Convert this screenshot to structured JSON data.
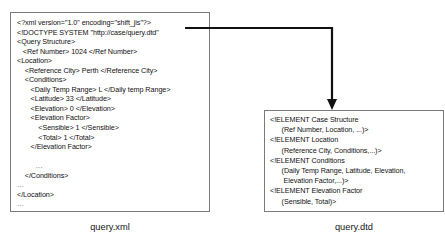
{
  "figure": {
    "xml_panel": {
      "caption": "query.xml",
      "lines": [
        {
          "text": "<?xml version=\"1.0\" encoding=\"shift_jis\"?>",
          "kind": "code"
        },
        {
          "text": "<!DOCTYPE SYSTEM \"http://case/query.dtd\"",
          "kind": "code"
        },
        {
          "text": "<Query Structure>",
          "kind": "code"
        },
        {
          "text": "   <Ref Number> 1024 </Ref Number>",
          "kind": "code"
        },
        {
          "text": "<Location>",
          "kind": "code"
        },
        {
          "text": "    <Reference City> Perth </Reference City>",
          "kind": "code"
        },
        {
          "text": "    <Conditions>",
          "kind": "code"
        },
        {
          "text": "       <Daily Temp Range> L </Daily temp Range>",
          "kind": "code"
        },
        {
          "text": "       <Latitude> 33 </Latitude>",
          "kind": "code"
        },
        {
          "text": "       <Elevation> 0 </Elevation>",
          "kind": "code"
        },
        {
          "text": "       <Elevation Factor>",
          "kind": "code"
        },
        {
          "text": "           <Sensible> 1 </Sensible>",
          "kind": "code"
        },
        {
          "text": "           <Total> 1 </Total>",
          "kind": "code"
        },
        {
          "text": "       </Elevation Factor>",
          "kind": "code"
        },
        {
          "text": "",
          "kind": "blank"
        },
        {
          "text": "        ...",
          "kind": "ellipsis"
        },
        {
          "text": "    </Conditions>",
          "kind": "code"
        },
        {
          "text": "...",
          "kind": "ellipsis"
        },
        {
          "text": "</Location>",
          "kind": "code"
        },
        {
          "text": "...",
          "kind": "ellipsis"
        },
        {
          "text": "</Query Structure>",
          "kind": "code"
        }
      ]
    },
    "dtd_panel": {
      "caption": "query.dtd",
      "lines": [
        {
          "text": "<!ELEMENT Case Structure",
          "kind": "code"
        },
        {
          "text": "      (Ref Number, Location, ...)>",
          "kind": "code"
        },
        {
          "text": "<!ELEMENT Location",
          "kind": "code"
        },
        {
          "text": "      (Reference City, Conditions,...)>",
          "kind": "code"
        },
        {
          "text": "<!ELEMENT Conditions",
          "kind": "code"
        },
        {
          "text": "      (Daily Temp Range, Latitude, Elevation,",
          "kind": "code"
        },
        {
          "text": "       Elevation Factor,...)>",
          "kind": "code"
        },
        {
          "text": "<!ELEMENT Elevation Factor",
          "kind": "code"
        },
        {
          "text": "      (Sensible, Total)>",
          "kind": "code"
        },
        {
          "text": "...",
          "kind": "ellipsis"
        }
      ]
    },
    "connector": {
      "label": "doctype-reference-arrow",
      "color": "#111111"
    }
  }
}
